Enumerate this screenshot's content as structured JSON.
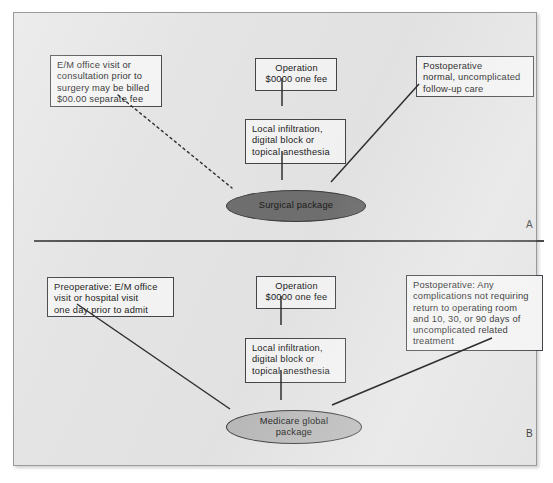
{
  "figure": {
    "panel_a": {
      "letter": "A",
      "center_node": "Surgical package",
      "center_node_color": "#6f6f6f",
      "boxes": {
        "preop": "E/M office visit or\nconsultation prior to\nsurgery may be billed\n$00.00 separate fee",
        "operation": "Operation\n$0000 one fee",
        "postop": "Postoperative\nnormal, uncomplicated\nfollow-up care",
        "anesthesia": "Local infiltration,\ndigital block or\ntopical anesthesia"
      },
      "connectors": [
        {
          "from": "preop",
          "to": "center_node",
          "style": "dotted"
        },
        {
          "from": "operation",
          "to": "anesthesia",
          "style": "solid"
        },
        {
          "from": "anesthesia",
          "to": "center_node",
          "style": "solid"
        },
        {
          "from": "postop",
          "to": "center_node",
          "style": "solid"
        }
      ]
    },
    "panel_b": {
      "letter": "B",
      "center_node": "Medicare global\npackage",
      "center_node_color": "#b9b9b9",
      "boxes": {
        "preop": "Preoperative: E/M office\nvisit or hospital visit\none day prior to admit",
        "operation": "Operation\n$0000 one fee",
        "postop": "Postoperative: Any\ncomplications not requiring\nreturn to operating room\nand 10, 30, or 90 days of\nuncomplicated related\ntreatment",
        "anesthesia": "Local infiltration,\ndigital block or\ntopical anesthesia"
      },
      "connectors": [
        {
          "from": "preop",
          "to": "center_node",
          "style": "solid"
        },
        {
          "from": "operation",
          "to": "anesthesia",
          "style": "solid"
        },
        {
          "from": "anesthesia",
          "to": "center_node",
          "style": "solid"
        },
        {
          "from": "postop",
          "to": "center_node",
          "style": "solid"
        }
      ]
    },
    "colors": {
      "panel_background": "#e4e4e4",
      "box_background": "#f3f3f3",
      "line": "#2f2f2f",
      "frame_border": "#9a9a9a"
    }
  }
}
